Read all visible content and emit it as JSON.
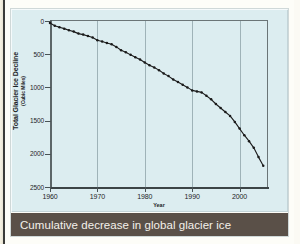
{
  "figure": {
    "caption": "Cumulative decrease in global glacier ice",
    "panel_color": "#dcedf0",
    "caption_bar_color": "#5a5048",
    "line_color": "#1a1a1a"
  },
  "chart_data": {
    "type": "line",
    "title": "Cumulative decrease in global glacier ice",
    "xlabel": "Year",
    "ylabel": "Total Glacier Ice Decline",
    "ylabel_units": "(Cubic Miles)",
    "xlim": [
      1960,
      2006
    ],
    "ylim": [
      0,
      2500
    ],
    "y_axis_inverted": true,
    "grid": "vertical-only",
    "legend": "none",
    "xticks": [
      1960,
      1970,
      1980,
      1990,
      2000
    ],
    "xtick_labels": [
      "1960",
      "1970",
      "1980",
      "1990",
      "2000"
    ],
    "yticks": [
      0,
      500,
      1000,
      1500,
      2000,
      2500
    ],
    "ytick_labels": [
      "0",
      "500",
      "1000",
      "1500",
      "2000",
      "2500"
    ],
    "marker": "filled-circle",
    "series": [
      {
        "name": "Total Glacier Ice Decline",
        "x": [
          1960,
          1961,
          1962,
          1963,
          1964,
          1965,
          1966,
          1967,
          1968,
          1969,
          1970,
          1971,
          1972,
          1973,
          1974,
          1975,
          1976,
          1977,
          1978,
          1979,
          1980,
          1981,
          1982,
          1983,
          1984,
          1985,
          1986,
          1987,
          1988,
          1989,
          1990,
          1991,
          1992,
          1993,
          1994,
          1995,
          1996,
          1997,
          1998,
          1999,
          2000,
          2001,
          2002,
          2003,
          2004,
          2005
        ],
        "values": [
          30,
          70,
          95,
          115,
          140,
          160,
          190,
          205,
          225,
          250,
          290,
          310,
          330,
          350,
          390,
          440,
          470,
          510,
          545,
          580,
          625,
          665,
          700,
          740,
          790,
          830,
          880,
          920,
          960,
          1000,
          1045,
          1060,
          1075,
          1125,
          1180,
          1250,
          1310,
          1370,
          1430,
          1520,
          1620,
          1720,
          1810,
          1910,
          2050,
          2180
        ]
      }
    ]
  }
}
